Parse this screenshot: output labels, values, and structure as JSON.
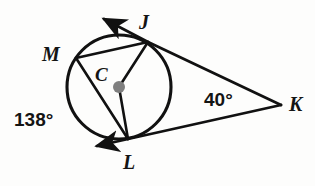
{
  "figure": {
    "type": "geometry-diagram",
    "stroke_color": "#111111",
    "center_dot_color": "#808080",
    "background_color": "#fdfdfc",
    "canvas": {
      "width": 315,
      "height": 186
    },
    "circle": {
      "cx": 119,
      "cy": 87,
      "r": 52
    },
    "points": [
      {
        "id": "J",
        "label": "J",
        "x": 148,
        "y": 42,
        "on_circle": true
      },
      {
        "id": "M",
        "label": "M",
        "x": 76,
        "y": 58,
        "on_circle": true
      },
      {
        "id": "L",
        "label": "L",
        "x": 128,
        "y": 139,
        "on_circle": true
      },
      {
        "id": "C",
        "label": "C",
        "x": 119,
        "y": 87,
        "on_circle": false
      },
      {
        "id": "K",
        "label": "K",
        "x": 281,
        "y": 105,
        "on_circle": false
      }
    ],
    "segments": [
      {
        "name": "chord-MJ",
        "from": "M",
        "to": "J"
      },
      {
        "name": "chord-ML",
        "from": "M",
        "to": "L"
      },
      {
        "name": "radius-CJ",
        "from": "C",
        "to": "J"
      },
      {
        "name": "radius-CL",
        "from": "C",
        "to": "L"
      },
      {
        "name": "secant-JK",
        "from": "J",
        "to": "K"
      },
      {
        "name": "tangent-LK",
        "from": "L",
        "to": "K"
      }
    ],
    "rays": [
      {
        "name": "ray-J-arrow",
        "from": "J",
        "tip_x": 100,
        "tip_y": 16,
        "arrow": true
      },
      {
        "name": "ray-L-arrow",
        "from": "L",
        "tip_x": 92,
        "tip_y": 148,
        "arrow": true
      }
    ],
    "labels": {
      "J": "J",
      "M": "M",
      "C": "C",
      "L": "L",
      "K": "K"
    },
    "angle_measures": {
      "arc_ml": "138°",
      "vertex_k": "40°"
    }
  }
}
